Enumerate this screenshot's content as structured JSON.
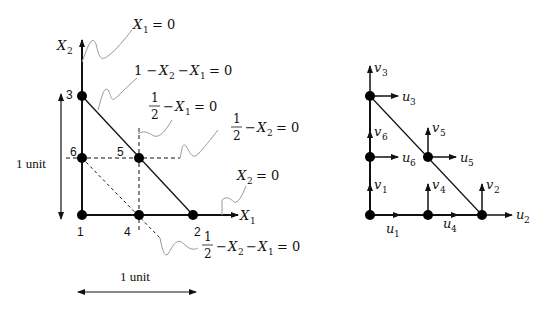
{
  "left_diagram": {
    "title": "Triangular element geometry with nodes and constraint lines",
    "axes": {
      "x_label": "X",
      "x_sub": "1",
      "y_label": "X",
      "y_sub": "2"
    },
    "nodes": [
      {
        "id": "1",
        "x": 0,
        "y": 0
      },
      {
        "id": "2",
        "x": 1,
        "y": 0
      },
      {
        "id": "3",
        "x": 0,
        "y": 1
      },
      {
        "id": "4",
        "x": 0.5,
        "y": 0
      },
      {
        "id": "5",
        "x": 0.5,
        "y": 0.5
      },
      {
        "id": "6",
        "x": 0,
        "y": 0.5
      }
    ],
    "annotations": {
      "x1_zero": "= 0",
      "hyp_prefix": "1 −",
      "hyp_mid": "−",
      "hyp_suffix": "= 0",
      "half_x1_suffix": "= 0",
      "half_x2_suffix": "= 0",
      "x2_zero": "= 0",
      "half_diag_suffix": "= 0",
      "frac_num": "1",
      "frac_den": "2",
      "minus": "−"
    },
    "dimension_labels": {
      "vertical": "1 unit",
      "horizontal": "1 unit"
    }
  },
  "right_diagram": {
    "title": "Nodal degrees of freedom",
    "dofs": [
      {
        "node": "1",
        "u": "u",
        "v": "v",
        "sub": "1"
      },
      {
        "node": "2",
        "u": "u",
        "v": "v",
        "sub": "2"
      },
      {
        "node": "3",
        "u": "u",
        "v": "v",
        "sub": "3"
      },
      {
        "node": "4",
        "u": "u",
        "v": "v",
        "sub": "4"
      },
      {
        "node": "5",
        "u": "u",
        "v": "v",
        "sub": "5"
      },
      {
        "node": "6",
        "u": "u",
        "v": "v",
        "sub": "6"
      }
    ]
  }
}
